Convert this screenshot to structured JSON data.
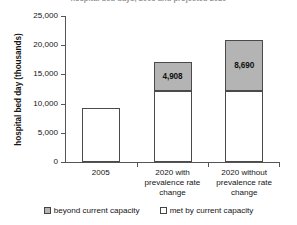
{
  "chart_data": {
    "type": "bar",
    "subtype": "stacked-bar",
    "title": "hospital bed days, 2005 and projected 2020",
    "xlabel": "",
    "ylabel": "hospital bed day (thousands)",
    "ylim": [
      0,
      25000
    ],
    "ytick_values": [
      0,
      5000,
      10000,
      15000,
      20000,
      25000
    ],
    "ytick_labels": [
      "0",
      "5,000",
      "10,000",
      "15,000",
      "20,000",
      "25,000"
    ],
    "grid": false,
    "legend_position": "bottom",
    "categories": [
      "2005",
      "2020 with prevalence rate change",
      "2020 without prevalence rate change"
    ],
    "category_lines": [
      [
        "2005"
      ],
      [
        "2020 with",
        "prevalence rate",
        "change"
      ],
      [
        "2020 without",
        "prevalence rate",
        "change"
      ]
    ],
    "series": [
      {
        "name": "met by current capacity",
        "color": "#ffffff",
        "values": [
          9300,
          12200,
          12200
        ],
        "labels": [
          "",
          "",
          ""
        ]
      },
      {
        "name": "beyond current capacity",
        "color": "#b4b4b4",
        "values": [
          0,
          4908,
          8690
        ],
        "labels": [
          "",
          "4,908",
          "8,690"
        ]
      }
    ],
    "totals": [
      9300,
      17108,
      20890
    ]
  },
  "legend": {
    "items": [
      {
        "label": "beyond current capacity",
        "swatch": "gray-swatch-icon"
      },
      {
        "label": "met by current capacity",
        "swatch": "white-swatch-icon"
      }
    ]
  },
  "colors": {
    "beyond_capacity": "#b4b4b4",
    "met_capacity": "#ffffff",
    "axis": "#555555",
    "text": "#141414"
  }
}
